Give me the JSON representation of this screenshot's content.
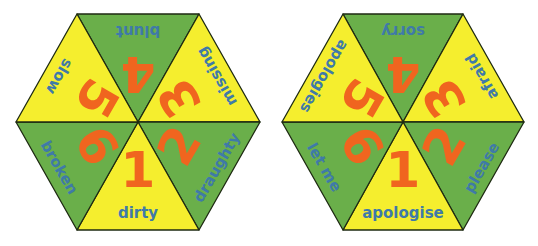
{
  "colors": {
    "yellow": "#f5ee2e",
    "green": "#6aaf4a",
    "number": "#f0651f",
    "word": "#3f7aa8",
    "outline": "#1e2a12"
  },
  "hexagons": [
    {
      "name": "left-hexagon",
      "segments": [
        {
          "number": "1",
          "word": "dirty",
          "position": "bottom",
          "color": "yellow"
        },
        {
          "number": "2",
          "word": "draughty",
          "position": "bottom-right",
          "color": "green"
        },
        {
          "number": "3",
          "word": "missing",
          "position": "top-right",
          "color": "yellow"
        },
        {
          "number": "4",
          "word": "blunt",
          "position": "top",
          "color": "green"
        },
        {
          "number": "5",
          "word": "slow",
          "position": "top-left",
          "color": "yellow"
        },
        {
          "number": "6",
          "word": "broken",
          "position": "bottom-left",
          "color": "green"
        }
      ]
    },
    {
      "name": "right-hexagon",
      "segments": [
        {
          "number": "1",
          "word": "apologise",
          "position": "bottom",
          "color": "yellow"
        },
        {
          "number": "2",
          "word": "please",
          "position": "bottom-right",
          "color": "green"
        },
        {
          "number": "3",
          "word": "afraid",
          "position": "top-right",
          "color": "yellow"
        },
        {
          "number": "4",
          "word": "sorry",
          "position": "top",
          "color": "green"
        },
        {
          "number": "5",
          "word": "apologies",
          "position": "top-left",
          "color": "yellow"
        },
        {
          "number": "6",
          "word": "let me",
          "position": "bottom-left",
          "color": "green"
        }
      ]
    }
  ]
}
